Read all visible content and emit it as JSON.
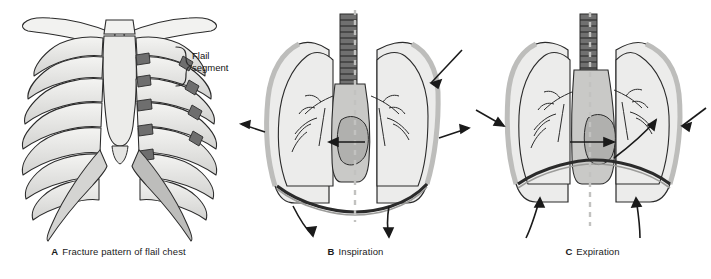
{
  "figure": {
    "background_color": "#ffffff",
    "width": 711,
    "height": 279
  },
  "palette": {
    "outline": "#2b2b2b",
    "bone_light": "#f2f2f0",
    "bone_mid": "#d8d8d6",
    "bone_shadow": "#a8a8a6",
    "fracture_dark": "#6e6e6e",
    "lung_fill": "#ececeb",
    "mediastinum_fill": "#c9c9c7",
    "mediastinum_dark": "#b0b0ae",
    "pleura_grey": "#bdbdbb",
    "midline_dash": "#c2c2c0",
    "arrow_black": "#1a1a1a",
    "trachea_dark": "#555555",
    "text": "#111111"
  },
  "panels": [
    {
      "id": "a",
      "letter": "A",
      "caption": "Fracture pattern of flail chest",
      "annotation": {
        "name": "flail-segment-label",
        "line1": "Flail",
        "line2": "segment"
      },
      "anatomy": [
        "clavicle",
        "sternum",
        "ribs",
        "costal-cartilage",
        "xiphoid-process",
        "rib-fractures"
      ],
      "description": "Anterior view of the thoracic cage showing a segment of ribs fractured in two places on the patient's left side, outlined by a brace."
    },
    {
      "id": "b",
      "letter": "B",
      "caption": "Inspiration",
      "anatomy": [
        "trachea",
        "lungs",
        "bronchial-tree",
        "mediastinum",
        "heart",
        "diaphragm",
        "chest-wall",
        "midline"
      ],
      "arrows": [
        {
          "name": "chest-wall-arrow-left-outward",
          "direction": "outward-left"
        },
        {
          "name": "chest-wall-arrow-right-upper-inward",
          "direction": "inward-down-left"
        },
        {
          "name": "chest-wall-arrow-right-lower-outward",
          "direction": "outward-right"
        },
        {
          "name": "mediastinal-shift-arrow",
          "direction": "left"
        },
        {
          "name": "diaphragm-arrow-left-descending",
          "direction": "down"
        },
        {
          "name": "diaphragm-arrow-right-descending",
          "direction": "down"
        }
      ],
      "description": "During inspiration the flail segment moves inward while the rest of the chest wall expands; the mediastinum shifts toward the uninjured side and the diaphragm descends."
    },
    {
      "id": "c",
      "letter": "C",
      "caption": "Expiration",
      "anatomy": [
        "trachea",
        "lungs",
        "bronchial-tree",
        "mediastinum",
        "heart",
        "diaphragm",
        "chest-wall",
        "midline"
      ],
      "arrows": [
        {
          "name": "chest-wall-arrow-left-inward",
          "direction": "inward-right"
        },
        {
          "name": "chest-wall-arrow-right-inward",
          "direction": "inward-down-left"
        },
        {
          "name": "flail-segment-arrow-outward",
          "direction": "up-right"
        },
        {
          "name": "mediastinal-shift-arrow",
          "direction": "right"
        },
        {
          "name": "diaphragm-arrow-left-ascending",
          "direction": "up"
        },
        {
          "name": "diaphragm-arrow-right-ascending",
          "direction": "up"
        }
      ],
      "description": "During expiration the flail segment bulges outward while the chest wall recoils inward; the mediastinum shifts back and the diaphragm ascends."
    }
  ]
}
